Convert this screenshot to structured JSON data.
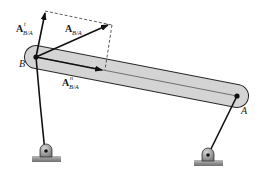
{
  "diagram": {
    "type": "rigid-body-kinematics",
    "points": {
      "B": {
        "label": "B"
      },
      "A": {
        "label": "A"
      }
    },
    "vectors": {
      "total": {
        "main": "A",
        "sub": "B/A",
        "sup": ""
      },
      "tangential": {
        "main": "A",
        "sub": "B/A",
        "sup": "t"
      },
      "normal": {
        "main": "A",
        "sub": "B/A",
        "sup": "n"
      }
    },
    "colors": {
      "bar_fill": "#d4d4d4",
      "bar_stroke": "#2a2a2a",
      "vector": "#111111",
      "ground": "#8a8a8a"
    }
  }
}
